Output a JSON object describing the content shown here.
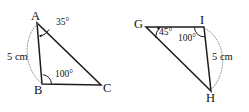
{
  "figure": {
    "background_color": "#ffffff",
    "stroke_color": "#1c1c1c",
    "arc_color": "#8a8a8a",
    "triangles": [
      {
        "name": "triangle-abc",
        "vertices": [
          {
            "label": "A",
            "x": 37,
            "y": 23
          },
          {
            "label": "B",
            "x": 42,
            "y": 84
          },
          {
            "label": "C",
            "x": 101,
            "y": 85
          }
        ],
        "angles": [
          {
            "at": "A",
            "value": "35°"
          },
          {
            "at": "B",
            "value": "100°"
          }
        ],
        "sides": [
          {
            "between": "AB",
            "value": "5 cm"
          }
        ]
      },
      {
        "name": "triangle-ghi",
        "vertices": [
          {
            "label": "G",
            "x": 146,
            "y": 27
          },
          {
            "label": "I",
            "x": 204,
            "y": 27
          },
          {
            "label": "H",
            "x": 211,
            "y": 91
          }
        ],
        "angles": [
          {
            "at": "G",
            "value": "45°"
          },
          {
            "at": "I",
            "value": "100°"
          }
        ],
        "sides": [
          {
            "between": "IH",
            "value": "5 cm"
          }
        ]
      }
    ]
  },
  "labels": {
    "a": "A",
    "b": "B",
    "c": "C",
    "g": "G",
    "i": "I",
    "h": "H",
    "angle_a": "35°",
    "angle_b": "100°",
    "angle_g": "45°",
    "angle_i": "100°",
    "len_ab": "5 cm",
    "len_ih": "5 cm"
  }
}
